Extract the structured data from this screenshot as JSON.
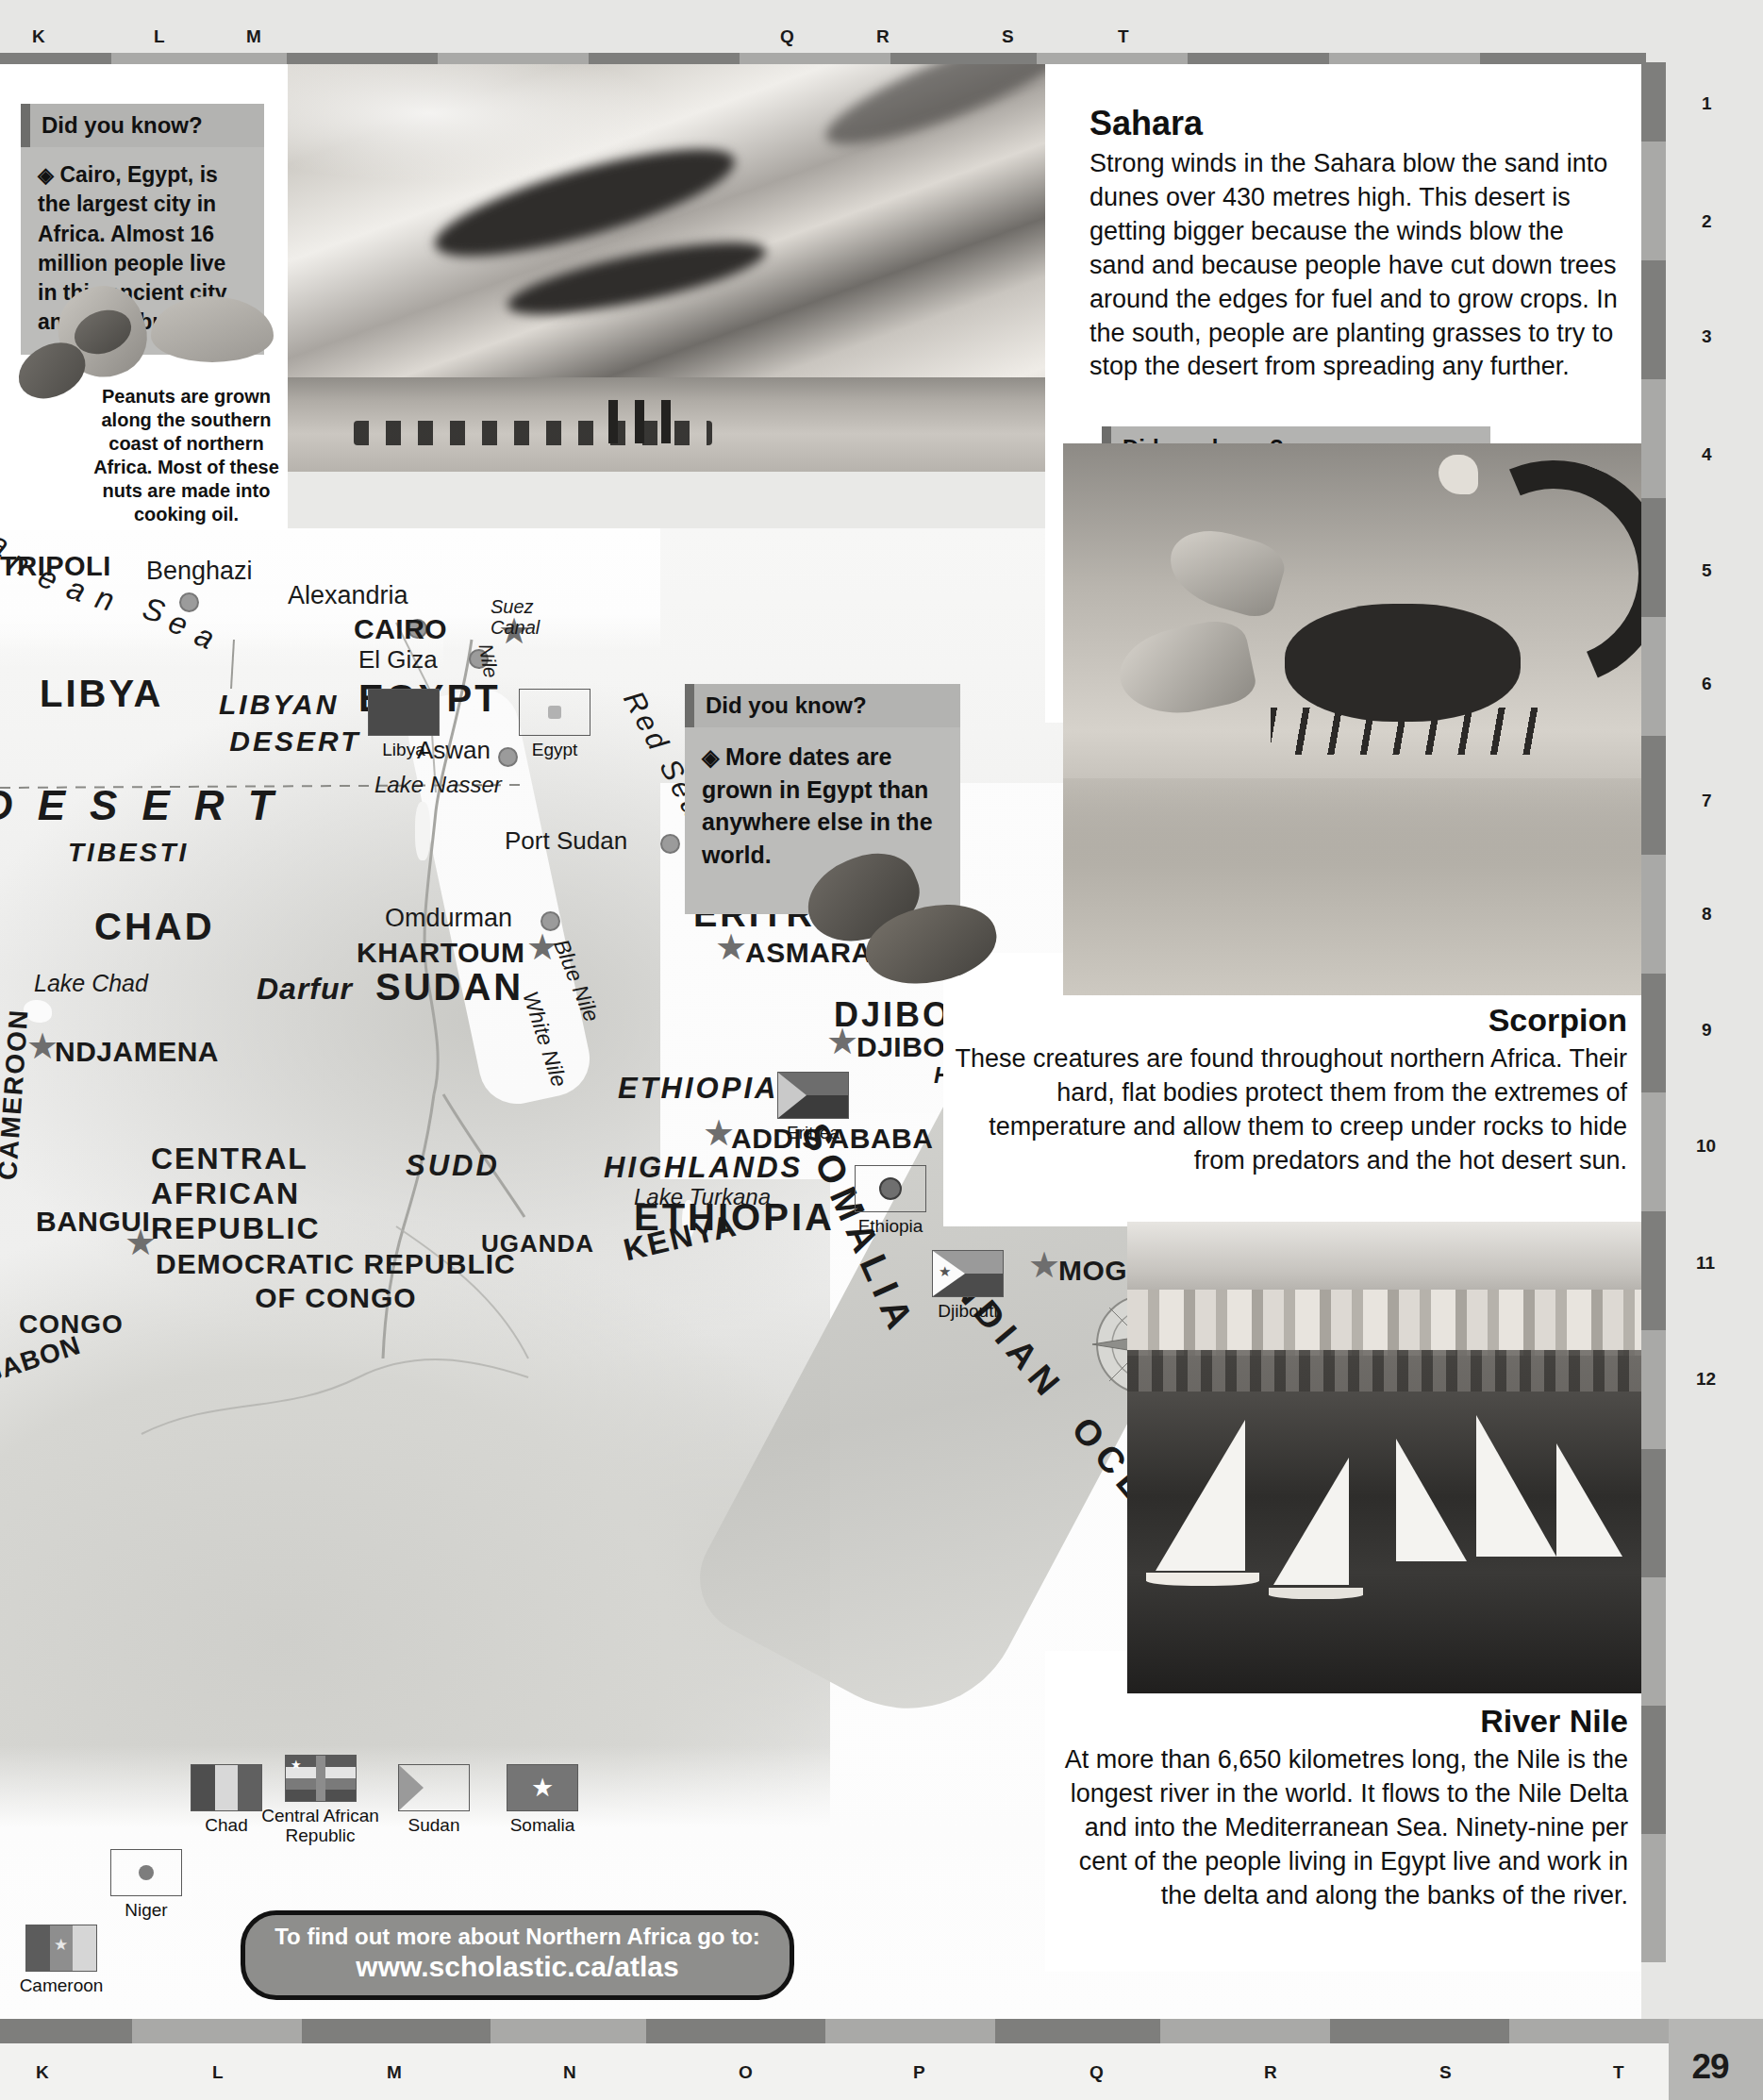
{
  "page": {
    "number": "29",
    "grid_letters_top": [
      "K",
      "L",
      "M",
      "Q",
      "R",
      "S",
      "T"
    ],
    "grid_letters_bottom": [
      "K",
      "L",
      "M",
      "N",
      "O",
      "P",
      "Q",
      "R",
      "S",
      "T"
    ],
    "grid_numbers_right": [
      "1",
      "2",
      "3",
      "4",
      "5",
      "6",
      "7",
      "8",
      "9",
      "10",
      "11",
      "12"
    ]
  },
  "did_you_know_cairo": {
    "heading": "Did you know?",
    "bullet": "◈",
    "text": "Cairo, Egypt, is the largest city in Africa. Almost 16 million people live in this ancient city and its suburbs."
  },
  "did_you_know_sahara": {
    "heading": "Did you know?",
    "bullet": "◈",
    "text": "“Sahara” is Arabic for desert. Less than 25 mm of rain falls there in a year."
  },
  "did_you_know_dates": {
    "heading": "Did you know?",
    "bullet": "◈",
    "text": "More dates are grown in Egypt than anywhere else in the world."
  },
  "peanut_caption": {
    "text": "Peanuts are grown along the southern coast of northern Africa. Most of these nuts are made into cooking oil."
  },
  "article_sahara": {
    "title": "Sahara",
    "body": "Strong winds in the Sahara blow the sand into dunes over 430 metres high. This desert is getting bigger because the winds blow the sand and because people have cut down trees around the edges for fuel and to grow crops. In the south, people are planting grasses to try to stop the desert from spreading any further."
  },
  "article_scorpion": {
    "title": "Scorpion",
    "body": "These creatures are found throughout northern Africa. Their hard, flat bodies protect them from the extremes of temperature and allow them to creep under rocks to hide from predators and the hot desert sun."
  },
  "article_nile": {
    "title": "River Nile",
    "body": "At more than 6,650 kilometres long, the Nile is the longest river in the world. It flows to the Nile Delta and into the Mediterranean Sea. Ninety-nine per cent of the people living in Egypt live and work in the delta and along the banks of the river."
  },
  "url_banner": {
    "line1": "To find out more about Northern Africa go to:",
    "line2": "www.scholastic.ca/atlas"
  },
  "flags": [
    {
      "name": "Libya"
    },
    {
      "name": "Egypt"
    },
    {
      "name": "Eritrea"
    },
    {
      "name": "Ethiopia"
    },
    {
      "name": "Djibouti"
    },
    {
      "name": "Niger"
    },
    {
      "name": "Chad"
    },
    {
      "name": "Central African Republic"
    },
    {
      "name": "Sudan"
    },
    {
      "name": "Somalia"
    },
    {
      "name": "Cameroon"
    }
  ],
  "map_labels": {
    "sea_mediterranean": "anean Sea",
    "sea_red": "Red Sea",
    "ocean_indian": "INDIAN OCEAN",
    "capitals": [
      "TRIPOLI",
      "CAIRO",
      "KHARTOUM",
      "NDJAMENA",
      "ASMARA",
      "DJIBOUTI",
      "ADDIS ABABA",
      "BANGUI",
      "MOGADISHU"
    ],
    "cities": [
      "Benghazi",
      "Alexandria",
      "El Giza",
      "Aswan",
      "Port Sudan",
      "Omdurman"
    ],
    "countries": [
      "LIBYA",
      "EGYPT",
      "CHAD",
      "SUDAN",
      "ERITREA",
      "DJIBOUTI",
      "ETHIOPIA",
      "SOMALIA",
      "CENTRAL AFRICAN REPUBLIC",
      "DEMOCRATIC REPUBLIC OF CONGO",
      "CONGO",
      "UGANDA",
      "KENYA",
      "CAMEROON",
      "GABON"
    ],
    "regions": [
      "LIBYAN DESERT",
      "DESERT",
      "TIBESTI",
      "Darfur",
      "SUDD",
      "ETHIOPIAN HIGHLANDS",
      "HORN OF AFRICA"
    ],
    "water_features": [
      "Suez Canal",
      "Nile",
      "Lake Nasser",
      "Lake Chad",
      "Blue Nile",
      "White Nile",
      "Lake Turkana"
    ],
    "compass_north": "N"
  }
}
